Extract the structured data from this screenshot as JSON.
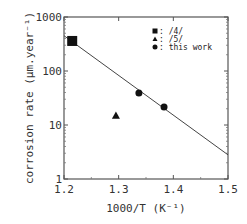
{
  "chart_data": {
    "type": "scatter",
    "title": "",
    "xlabel": "1000/T  (K⁻¹)",
    "ylabel": "corrosion rate  (μm.year⁻¹)",
    "xlim": [
      1.2,
      1.5
    ],
    "ylim": [
      1,
      1000
    ],
    "yscale": "log",
    "x_ticks": [
      "1.2",
      "1.3",
      "1.4",
      "1.5"
    ],
    "y_ticks": [
      "1",
      "10",
      "100",
      "1000"
    ],
    "grid": false,
    "legend_position": "upper right (inside)",
    "series": [
      {
        "name": "/4/",
        "marker": "square",
        "points": [
          {
            "x": 1.215,
            "y": 360
          }
        ]
      },
      {
        "name": "/5/",
        "marker": "triangle",
        "points": [
          {
            "x": 1.295,
            "y": 15
          }
        ]
      },
      {
        "name": "this work",
        "marker": "circle",
        "points": [
          {
            "x": 1.337,
            "y": 39
          },
          {
            "x": 1.383,
            "y": 21.5
          }
        ]
      }
    ],
    "fit_line": {
      "x": [
        1.2,
        1.5
      ],
      "y": [
        450,
        2.8
      ]
    }
  },
  "legend": [
    {
      "marker": "square",
      "label": ": /4/"
    },
    {
      "marker": "triangle",
      "label": ": /5/"
    },
    {
      "marker": "circle",
      "label": ": this work"
    }
  ]
}
